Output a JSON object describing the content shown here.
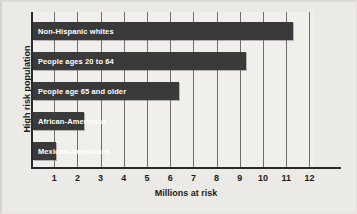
{
  "chart_data": {
    "type": "bar",
    "orientation": "horizontal",
    "title": "",
    "xlabel": "Millions at risk",
    "ylabel": "High risk population",
    "categories": [
      "Non-Hispanic whites",
      "People ages 20 to 64",
      "People age 65 and older",
      "African-Americans",
      "Mexican-Americans"
    ],
    "values": [
      11.2,
      9.2,
      6.3,
      2.2,
      1.0
    ],
    "xlim": [
      0,
      12
    ],
    "xticks": [
      "1",
      "2",
      "3",
      "4",
      "5",
      "6",
      "7",
      "8",
      "9",
      "10",
      "11",
      "12"
    ],
    "grid": "vertical",
    "legend": "none",
    "bar_color": "#3a3a3a",
    "background_color": "#eceae7",
    "plot_background_color": "#f1efec",
    "axis_color": "#2a2a2a",
    "gridline_color": "#6f6d6b",
    "label_text_color": "#ffffff"
  }
}
